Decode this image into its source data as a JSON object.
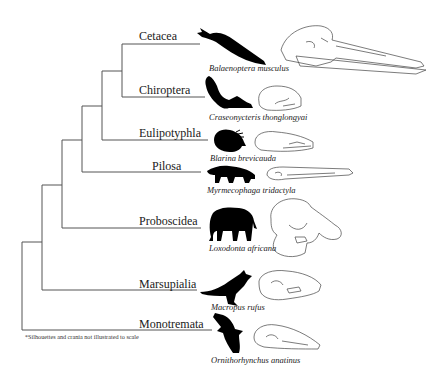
{
  "figure": {
    "type": "phylogenetic-tree",
    "footnote": "*Silhouettes and crania not illustrated to scale",
    "line_color": "#555555",
    "silhouette_color": "#000000",
    "clades": [
      {
        "label": "Cetacea",
        "species": "Balaenoptera musculus"
      },
      {
        "label": "Chiroptera",
        "species": "Craseonycteris thonglongyai"
      },
      {
        "label": "Eulipotyphla",
        "species": "Blarina brevicauda"
      },
      {
        "label": "Pilosa",
        "species": "Myrmecophaga tridactyla"
      },
      {
        "label": "Proboscidea",
        "species": "Loxodonta africana"
      },
      {
        "label": "Marsupialia",
        "species": "Macropus rufus"
      },
      {
        "label": "Monotremata",
        "species": "Ornithorhynchus anatinus"
      }
    ]
  }
}
